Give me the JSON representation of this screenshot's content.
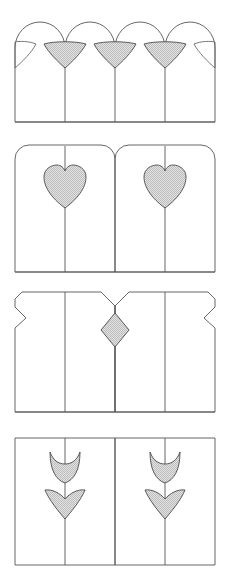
{
  "document": {
    "title": "Decorative Panel Motif Plate",
    "kind": "line-drawing-plate",
    "background_color": "#ffffff",
    "stroke_color": "#4a4a4a",
    "fill_color": "#d0d0d0",
    "fill_style": "fine checkered halftone",
    "stroke_width": 0.9,
    "width_px": 231,
    "height_px": 580,
    "panel_count": 4,
    "left_margin_px": 15,
    "right_margin_px": 215
  },
  "figures": [
    {
      "index": 1,
      "name": "arched-fence-with-fan-motifs",
      "label": "Arched pickets with shell-fan spandrels",
      "top_px": 14,
      "bottom_px": 122,
      "picket_count": 4,
      "motif": "fan",
      "motif_filled_count": 3,
      "motif_half_count": 2,
      "motif_description": "Shell fan formed between adjacent arches, point down",
      "divider_x_positions": [
        65,
        115,
        165
      ],
      "arch_top_y": 22,
      "arch_spring_y": 48
    },
    {
      "index": 2,
      "name": "round-corner-panels-with-hearts",
      "label": "Round-cornered panels with heart cut-outs",
      "top_px": 145,
      "bottom_px": 272,
      "panel_count": 2,
      "slat_count": 4,
      "motif": "heart",
      "motif_filled_count": 2,
      "corner_radius_px": 14,
      "divider_x_positions": [
        65,
        115,
        165
      ],
      "heart_centers": [
        [
          65,
          185
        ],
        [
          165,
          185
        ]
      ]
    },
    {
      "index": 3,
      "name": "chamfered-panels-with-diamond",
      "label": "Chamfered panels with central diamond",
      "top_px": 292,
      "bottom_px": 412,
      "panel_count": 2,
      "slat_count": 4,
      "motif": "diamond",
      "motif_filled_count": 1,
      "notch_depth_px": 11,
      "divider_x_positions": [
        65,
        115,
        165
      ],
      "diamond_center": [
        115,
        330
      ],
      "diamond_half_width_px": 14,
      "diamond_half_height_px": 17
    },
    {
      "index": 4,
      "name": "flat-panels-with-tulip-motifs",
      "label": "Flat-topped panels with tulip and leaf motifs",
      "top_px": 438,
      "bottom_px": 565,
      "panel_count": 2,
      "slat_count": 4,
      "motif": "tulip",
      "motif_filled_count": 4,
      "motif_parts": [
        "crescent cup",
        "chevron leaf"
      ],
      "divider_x_positions": [
        65,
        115,
        165
      ],
      "tulip_centers": [
        [
          65,
          465
        ],
        [
          165,
          465
        ]
      ],
      "leaf_centers": [
        [
          65,
          500
        ],
        [
          165,
          500
        ]
      ]
    }
  ],
  "legend": {
    "filled_meaning": "Ornament panel (shaded)",
    "outline_meaning": "Plain board / frame"
  }
}
